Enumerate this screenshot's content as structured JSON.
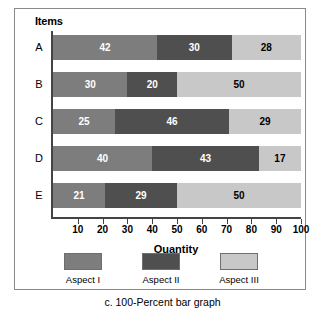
{
  "figure": {
    "caption": "c. 100-Percent bar graph",
    "y_axis_title": "Items",
    "x_axis_title": "Quantity"
  },
  "legend": {
    "items": [
      {
        "label": "Aspect I",
        "color": "#7d7d7d"
      },
      {
        "label": "Aspect II",
        "color": "#4f4f4f"
      },
      {
        "label": "Aspect III",
        "color": "#c8c8c8"
      }
    ]
  },
  "axis": {
    "ticks": [
      "10",
      "20",
      "30",
      "40",
      "50",
      "60",
      "70",
      "80",
      "90",
      "100"
    ]
  },
  "chart_data": {
    "type": "bar",
    "orientation": "horizontal",
    "stacked": true,
    "normalized_100_percent": true,
    "title": "",
    "xlabel": "Quantity",
    "ylabel": "Items",
    "xlim": [
      0,
      100
    ],
    "grid": false,
    "legend_position": "bottom",
    "categories": [
      "A",
      "B",
      "C",
      "D",
      "E"
    ],
    "series": [
      {
        "name": "Aspect I",
        "color": "#7d7d7d",
        "values": [
          42,
          30,
          25,
          40,
          21
        ]
      },
      {
        "name": "Aspect II",
        "color": "#4f4f4f",
        "values": [
          30,
          20,
          46,
          43,
          29
        ]
      },
      {
        "name": "Aspect III",
        "color": "#c8c8c8",
        "values": [
          28,
          50,
          29,
          17,
          50
        ]
      }
    ],
    "rows": [
      {
        "category": "A",
        "segments": [
          {
            "series": "Aspect I",
            "value": 42
          },
          {
            "series": "Aspect II",
            "value": 30
          },
          {
            "series": "Aspect III",
            "value": 28
          }
        ]
      },
      {
        "category": "B",
        "segments": [
          {
            "series": "Aspect I",
            "value": 30
          },
          {
            "series": "Aspect II",
            "value": 20
          },
          {
            "series": "Aspect III",
            "value": 50
          }
        ]
      },
      {
        "category": "C",
        "segments": [
          {
            "series": "Aspect I",
            "value": 25
          },
          {
            "series": "Aspect II",
            "value": 46
          },
          {
            "series": "Aspect III",
            "value": 29
          }
        ]
      },
      {
        "category": "D",
        "segments": [
          {
            "series": "Aspect I",
            "value": 40
          },
          {
            "series": "Aspect II",
            "value": 43
          },
          {
            "series": "Aspect III",
            "value": 17
          }
        ]
      },
      {
        "category": "E",
        "segments": [
          {
            "series": "Aspect I",
            "value": 21
          },
          {
            "series": "Aspect II",
            "value": 29
          },
          {
            "series": "Aspect III",
            "value": 50
          }
        ]
      }
    ]
  }
}
